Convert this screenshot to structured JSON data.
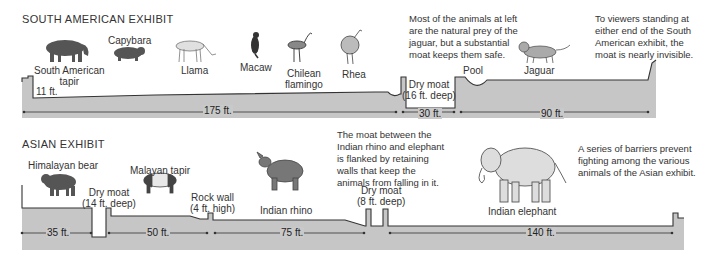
{
  "colors": {
    "ground": "#c6c6c6",
    "outline": "#333333",
    "text": "#333333",
    "background": "#ffffff"
  },
  "south_american": {
    "title": "SOUTH AMERICAN EXHIBIT",
    "animals": {
      "tapir_line1": "South American",
      "tapir_line2": "tapir",
      "capybara": "Capybara",
      "llama": "Llama",
      "macaw": "Macaw",
      "flamingo_line1": "Chilean",
      "flamingo_line2": "flamingo",
      "rhea": "Rhea",
      "jaguar": "Jaguar"
    },
    "features": {
      "wall_height": "11 ft.",
      "moat_line1": "Dry moat",
      "moat_line2": "(16 ft. deep)",
      "pool": "Pool"
    },
    "dimensions": {
      "d1": "175 ft.",
      "d2": "30 ft.",
      "d3": "90 ft."
    },
    "notes": {
      "prey_note": [
        "Most of the animals at left",
        "are the natural prey of the",
        "jaguar, but a substantial",
        "moat keeps them safe."
      ],
      "viewer_note": [
        "To viewers standing at",
        "either end of the South",
        "American exhibit, the",
        "moat is nearly invisible."
      ]
    }
  },
  "asian": {
    "title": "ASIAN EXHIBIT",
    "animals": {
      "bear": "Himalayan bear",
      "tapir": "Malayan tapir",
      "rhino": "Indian rhino",
      "elephant": "Indian elephant"
    },
    "features": {
      "moat1_line1": "Dry moat",
      "moat1_line2": "(14 ft. deep)",
      "rock_line1": "Rock wall",
      "rock_line2": "(4 ft. high)",
      "moat2_line1": "Dry moat",
      "moat2_line2": "(8 ft. deep)"
    },
    "dimensions": {
      "d1": "35 ft.",
      "d2": "50 ft.",
      "d3": "75 ft.",
      "d4": "140 ft."
    },
    "notes": {
      "moat_note": [
        "The moat between the",
        "Indian rhino and elephant",
        "is flanked by retaining",
        "walls that keep the",
        "animals from falling in it."
      ],
      "barrier_note": [
        "A series of barriers prevent",
        "fighting among the various",
        "animals of the Asian exhibit."
      ]
    }
  }
}
